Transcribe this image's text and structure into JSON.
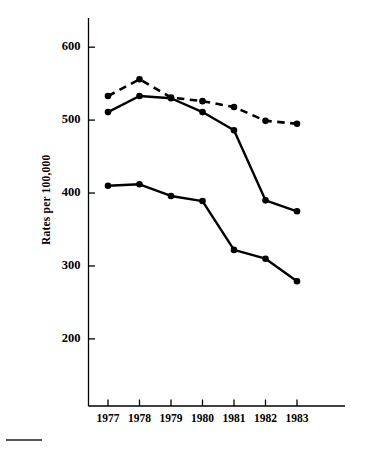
{
  "figure": {
    "background": "#ffffff",
    "ink_color": "#000000",
    "footnote_rule": {
      "present": true,
      "color": "#555555"
    }
  },
  "chart_data": {
    "type": "line",
    "title": "",
    "subtitle": "",
    "xlabel": "",
    "ylabel": "Rates per 100,000",
    "x": [
      1977,
      1978,
      1979,
      1980,
      1981,
      1982,
      1983
    ],
    "categories": [
      "1977",
      "1978",
      "1979",
      "1980",
      "1981",
      "1982",
      "1983"
    ],
    "xlim": [
      1976.3,
      1983.9
    ],
    "ylim": [
      108,
      640
    ],
    "yticks": [
      200,
      300,
      400,
      500,
      600
    ],
    "ytick_labels": [
      "200",
      "300",
      "400",
      "500",
      "600"
    ],
    "grid": false,
    "legend": "none",
    "series": [
      {
        "name": "upper-dashed",
        "style": "dashed",
        "marker": "filled-circle",
        "color": "#000000",
        "values": [
          533,
          556,
          531,
          526,
          518,
          499,
          495
        ]
      },
      {
        "name": "middle-solid",
        "style": "solid",
        "marker": "filled-circle",
        "color": "#000000",
        "values": [
          511,
          533,
          530,
          511,
          486,
          390,
          375
        ]
      },
      {
        "name": "lower-solid",
        "style": "solid",
        "marker": "filled-circle",
        "color": "#000000",
        "values": [
          410,
          412,
          396,
          389,
          322,
          310,
          279
        ]
      }
    ]
  }
}
